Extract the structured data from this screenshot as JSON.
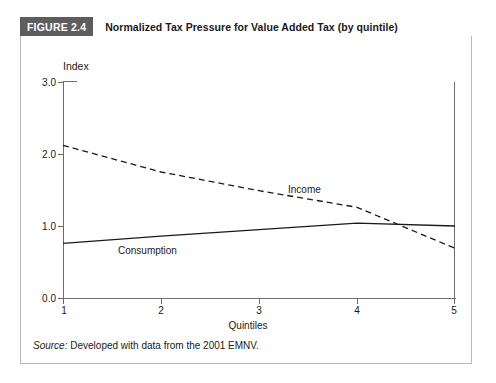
{
  "figure": {
    "number_badge": "FIGURE 2.4",
    "title": "Normalized Tax Pressure for Value Added Tax (by quintile)",
    "source_label": "Source:",
    "source_text": " Developed with data from the 2001 EMNV.",
    "badge_bg_color": "#5d5d5d",
    "badge_text_color": "#ffffff",
    "panel_border_color": "#b9b9b9",
    "axis_color": "#6d6d6d",
    "series_color": "#1a1a1a"
  },
  "chart_data": {
    "type": "line",
    "title": "Normalized Tax Pressure for Value Added Tax (by quintile)",
    "xlabel": "Quintiles",
    "ylabel": "Index",
    "x": [
      1,
      2,
      3,
      4,
      5
    ],
    "xtick_labels": [
      "1",
      "2",
      "3",
      "4",
      "5"
    ],
    "ytick_labels": [
      "0.0",
      "1.0",
      "2.0",
      "3.0"
    ],
    "yticks": [
      0.0,
      1.0,
      2.0,
      3.0
    ],
    "xlim": [
      1,
      5
    ],
    "ylim": [
      0.0,
      3.0
    ],
    "grid": false,
    "legend": "inline-annotations",
    "series": [
      {
        "name": "Income",
        "style": "dashed",
        "values": [
          2.12,
          1.75,
          1.49,
          1.26,
          0.69
        ],
        "label_text": "Income"
      },
      {
        "name": "Consumption",
        "style": "solid",
        "values": [
          0.76,
          0.86,
          0.95,
          1.04,
          1.0
        ],
        "label_text": "Consumption"
      }
    ],
    "annotations": [
      {
        "text": "Income",
        "x": 3.35,
        "y": 1.6
      },
      {
        "text": "Consumption",
        "x": 1.65,
        "y": 0.74
      }
    ]
  }
}
